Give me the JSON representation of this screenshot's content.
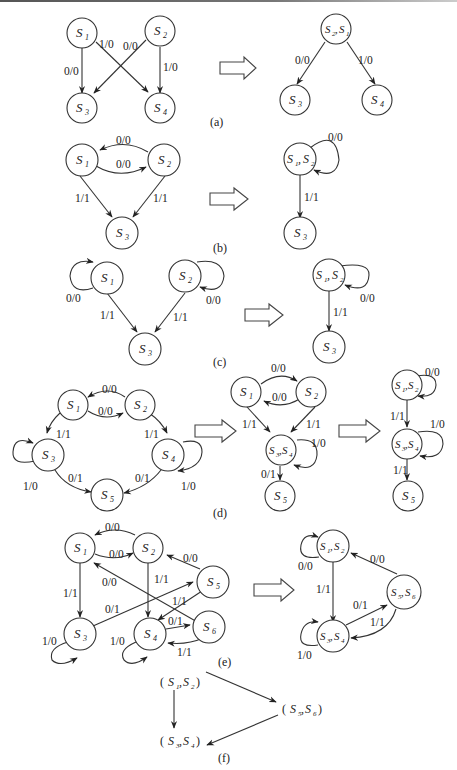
{
  "figure": {
    "panels": [
      {
        "id": "a",
        "caption": "(a)",
        "left": {
          "nodes": [
            "S1",
            "S2",
            "S3",
            "S4"
          ],
          "edges": [
            {
              "from": "S1",
              "to": "S3",
              "label": "0/0"
            },
            {
              "from": "S1",
              "to": "S4",
              "label": "1/0"
            },
            {
              "from": "S2",
              "to": "S3",
              "label": "0/0"
            },
            {
              "from": "S2",
              "to": "S4",
              "label": "1/0"
            }
          ]
        },
        "right": {
          "nodes": [
            "S2, S1",
            "S3",
            "S4"
          ],
          "edges": [
            {
              "from": "S2, S1",
              "to": "S3",
              "label": "0/0"
            },
            {
              "from": "S2, S1",
              "to": "S4",
              "label": "1/0"
            }
          ]
        }
      },
      {
        "id": "b",
        "caption": "(b)",
        "left": {
          "nodes": [
            "S1",
            "S2",
            "S3"
          ],
          "edges": [
            {
              "from": "S2",
              "to": "S1",
              "label": "0/0"
            },
            {
              "from": "S1",
              "to": "S2",
              "label": "0/0"
            },
            {
              "from": "S1",
              "to": "S3",
              "label": "1/1"
            },
            {
              "from": "S2",
              "to": "S3",
              "label": "1/1"
            }
          ]
        },
        "right": {
          "nodes": [
            "S1, S2",
            "S3"
          ],
          "edges": [
            {
              "from": "S1, S2",
              "to": "S1, S2",
              "label": "0/0"
            },
            {
              "from": "S1, S2",
              "to": "S3",
              "label": "1/1"
            }
          ]
        }
      },
      {
        "id": "c",
        "caption": "(c)",
        "left": {
          "nodes": [
            "S1",
            "S2",
            "S3"
          ],
          "edges": [
            {
              "from": "S1",
              "to": "S1",
              "label": "0/0"
            },
            {
              "from": "S2",
              "to": "S2",
              "label": "0/0"
            },
            {
              "from": "S1",
              "to": "S3",
              "label": "1/1"
            },
            {
              "from": "S2",
              "to": "S3",
              "label": "1/1"
            }
          ]
        },
        "right": {
          "nodes": [
            "S1, S2",
            "S3"
          ],
          "edges": [
            {
              "from": "S1, S2",
              "to": "S1, S2",
              "label": "0/0"
            },
            {
              "from": "S1, S2",
              "to": "S3",
              "label": "1/1"
            }
          ]
        }
      },
      {
        "id": "d",
        "caption": "(d)",
        "left": {
          "nodes": [
            "S1",
            "S2",
            "S3",
            "S4",
            "S5"
          ],
          "edges": [
            {
              "from": "S2",
              "to": "S1",
              "label": "0/0"
            },
            {
              "from": "S1",
              "to": "S2",
              "label": "0/0"
            },
            {
              "from": "S1",
              "to": "S3",
              "label": "1/1"
            },
            {
              "from": "S2",
              "to": "S4",
              "label": "1/1"
            },
            {
              "from": "S3",
              "to": "S3",
              "label": "1/0"
            },
            {
              "from": "S4",
              "to": "S4",
              "label": "1/0"
            },
            {
              "from": "S3",
              "to": "S5",
              "label": "0/1"
            },
            {
              "from": "S4",
              "to": "S5",
              "label": "0/1"
            }
          ]
        },
        "middle": {
          "nodes": [
            "S1",
            "S2",
            "S3,S4",
            "S5"
          ],
          "edges": [
            {
              "from": "S1",
              "to": "S2",
              "label": "0/0"
            },
            {
              "from": "S2",
              "to": "S1",
              "label": "0/0"
            },
            {
              "from": "S1",
              "to": "S3,S4",
              "label": "1/1"
            },
            {
              "from": "S2",
              "to": "S3,S4",
              "label": "1/1"
            },
            {
              "from": "S3,S4",
              "to": "S3,S4",
              "label": "1/0"
            },
            {
              "from": "S3,S4",
              "to": "S5",
              "label": "0/1"
            }
          ]
        },
        "right": {
          "nodes": [
            "S1,S2",
            "S3,S4",
            "S5"
          ],
          "edges": [
            {
              "from": "S1,S2",
              "to": "S1,S2",
              "label": "0/0"
            },
            {
              "from": "S1,S2",
              "to": "S3,S4",
              "label": "1/1"
            },
            {
              "from": "S3,S4",
              "to": "S3,S4",
              "label": "1/0"
            },
            {
              "from": "S3,S4",
              "to": "S5",
              "label": "1/1"
            }
          ]
        }
      },
      {
        "id": "e",
        "caption": "(e)",
        "left": {
          "nodes": [
            "S1",
            "S2",
            "S3",
            "S4",
            "S5",
            "S6"
          ],
          "edges": [
            {
              "from": "S2",
              "to": "S1",
              "label": "0/0"
            },
            {
              "from": "S1",
              "to": "S2",
              "label": "0/0"
            },
            {
              "from": "S5",
              "to": "S2",
              "label": "0/0"
            },
            {
              "from": "S6",
              "to": "S1",
              "label": "0/0"
            },
            {
              "from": "S1",
              "to": "S3",
              "label": "1/1"
            },
            {
              "from": "S2",
              "to": "S4",
              "label": "1/1"
            },
            {
              "from": "S5",
              "to": "S4",
              "label": "1/1"
            },
            {
              "from": "S3",
              "to": "S5",
              "label": "0/1"
            },
            {
              "from": "S4",
              "to": "S6",
              "label": "0/1"
            },
            {
              "from": "S6",
              "to": "S4",
              "label": "1/1"
            },
            {
              "from": "S3",
              "to": "S3",
              "label": "1/0"
            },
            {
              "from": "S4",
              "to": "S4",
              "label": "1/0"
            }
          ]
        },
        "right": {
          "nodes": [
            "S1,S2",
            "S3,S4",
            "S5,S6"
          ],
          "edges": [
            {
              "from": "S1,S2",
              "to": "S1,S2",
              "label": "0/0"
            },
            {
              "from": "S5,S6",
              "to": "S1,S2",
              "label": "0/0"
            },
            {
              "from": "S1,S2",
              "to": "S3,S4",
              "label": "1/1"
            },
            {
              "from": "S3,S4",
              "to": "S5,S6",
              "label": "0/1"
            },
            {
              "from": "S5,S6",
              "to": "S3,S4",
              "label": "1/1"
            },
            {
              "from": "S3,S4",
              "to": "S3,S4",
              "label": "1/0"
            }
          ]
        }
      },
      {
        "id": "f",
        "caption": "(f)",
        "nodes": [
          "(S1,S2)",
          "(S5,S6)",
          "(S3,S4)"
        ],
        "edges": [
          {
            "from": "(S1,S2)",
            "to": "(S5,S6)"
          },
          {
            "from": "(S1,S2)",
            "to": "(S3,S4)"
          },
          {
            "from": "(S5,S6)",
            "to": "(S3,S4)"
          }
        ]
      }
    ]
  },
  "labels": {
    "S": "S",
    "l00": "0/0",
    "l10": "1/0",
    "l11": "1/1",
    "l01": "0/1",
    "cap_a": "(a)",
    "cap_b": "(b)",
    "cap_c": "(c)",
    "cap_d": "(d)",
    "cap_e": "(e)",
    "cap_f": "(f)",
    "sub1": "1",
    "sub2": "2",
    "sub3": "3",
    "sub4": "4",
    "sub5": "5",
    "sub6": "6",
    "comma": ",",
    "comma_sp": ", ",
    "lparen": "(",
    "rparen": ")"
  }
}
